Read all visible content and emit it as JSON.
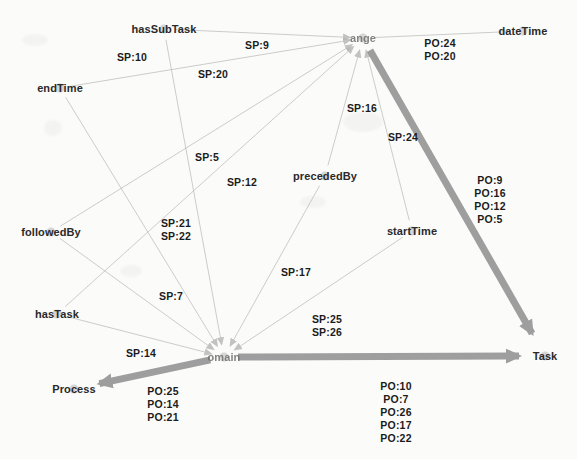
{
  "diagram": {
    "colors": {
      "thin_edge": "#b9b9b9",
      "thick_edge": "#9a9a9a",
      "node_text": "#2a2a2a",
      "label_text": "#1b1b1b",
      "background": "#fbfbfa"
    },
    "nodes": [
      {
        "id": "hasSubTask",
        "label": "hasSubTask",
        "x": 164,
        "y": 29,
        "faded": false
      },
      {
        "id": "dateTime",
        "label": "dateTime",
        "x": 523,
        "y": 31,
        "faded": false
      },
      {
        "id": "range",
        "label": "ange",
        "x": 363,
        "y": 38,
        "faded": true
      },
      {
        "id": "endTime",
        "label": "endTime",
        "x": 60,
        "y": 88,
        "faded": false
      },
      {
        "id": "precededBy",
        "label": "precededBy",
        "x": 325,
        "y": 176,
        "faded": false
      },
      {
        "id": "followedBy",
        "label": "followedBy",
        "x": 51,
        "y": 232,
        "faded": false
      },
      {
        "id": "startTime",
        "label": "startTime",
        "x": 412,
        "y": 231,
        "faded": false
      },
      {
        "id": "hasTask",
        "label": "hasTask",
        "x": 57,
        "y": 314,
        "faded": false
      },
      {
        "id": "domain",
        "label": "omain",
        "x": 224,
        "y": 357,
        "faded": true
      },
      {
        "id": "Task",
        "label": "Task",
        "x": 545,
        "y": 356,
        "faded": false
      },
      {
        "id": "Process",
        "label": "Process",
        "x": 74,
        "y": 389,
        "faded": false
      }
    ],
    "edge_labels": [
      {
        "id": "sp9",
        "text": "SP:9",
        "x": 257,
        "y": 45
      },
      {
        "id": "sp10",
        "text": "SP:10",
        "x": 132,
        "y": 57
      },
      {
        "id": "po24_20",
        "text": "PO:24\nPO:20",
        "x": 440,
        "y": 50
      },
      {
        "id": "sp20",
        "text": "SP:20",
        "x": 213,
        "y": 74
      },
      {
        "id": "sp16",
        "text": "SP:16",
        "x": 362,
        "y": 108
      },
      {
        "id": "sp24",
        "text": "SP:24",
        "x": 403,
        "y": 137
      },
      {
        "id": "sp5",
        "text": "SP:5",
        "x": 207,
        "y": 157
      },
      {
        "id": "sp12",
        "text": "SP:12",
        "x": 242,
        "y": 182
      },
      {
        "id": "po_right",
        "text": "PO:9\nPO:16\nPO:12\nPO:5",
        "x": 490,
        "y": 200
      },
      {
        "id": "sp21_22",
        "text": "SP:21\nSP:22",
        "x": 176,
        "y": 230
      },
      {
        "id": "sp17",
        "text": "SP:17",
        "x": 296,
        "y": 272
      },
      {
        "id": "sp7",
        "text": "SP:7",
        "x": 171,
        "y": 296
      },
      {
        "id": "sp25_26",
        "text": "SP:25\nSP:26",
        "x": 327,
        "y": 326
      },
      {
        "id": "sp14",
        "text": "SP:14",
        "x": 141,
        "y": 353
      },
      {
        "id": "po25_14_21",
        "text": "PO:25\nPO:14\nPO:21",
        "x": 163,
        "y": 404
      },
      {
        "id": "po_bottom",
        "text": "PO:10\nPO:7\nPO:26\nPO:17\nPO:22",
        "x": 396,
        "y": 412
      }
    ],
    "edges": [
      {
        "id": "hasSubTask-range",
        "from": "hasSubTask",
        "to": "range",
        "weight": "thin",
        "arrow": true
      },
      {
        "id": "endTime-range",
        "from": "endTime",
        "to": "range",
        "weight": "thin",
        "arrow": true
      },
      {
        "id": "precededBy-range",
        "from": "precededBy",
        "to": "range",
        "weight": "thin",
        "arrow": true
      },
      {
        "id": "startTime-range",
        "from": "startTime",
        "to": "range",
        "weight": "thin",
        "arrow": true
      },
      {
        "id": "followedBy-range",
        "from": "followedBy",
        "to": "range",
        "weight": "thin",
        "arrow": true
      },
      {
        "id": "hasTask-range",
        "from": "hasTask",
        "to": "range",
        "weight": "thin",
        "arrow": true
      },
      {
        "id": "range-dateTime",
        "from": "range",
        "to": "dateTime",
        "weight": "thin",
        "arrow": false
      },
      {
        "id": "range-Task",
        "from": "range",
        "to": "Task",
        "weight": "thick",
        "arrow": true
      },
      {
        "id": "hasSubTask-domain",
        "from": "hasSubTask",
        "to": "domain",
        "weight": "thin",
        "arrow": true
      },
      {
        "id": "endTime-domain",
        "from": "endTime",
        "to": "domain",
        "weight": "thin",
        "arrow": true
      },
      {
        "id": "followedBy-domain",
        "from": "followedBy",
        "to": "domain",
        "weight": "thin",
        "arrow": true
      },
      {
        "id": "hasTask-domain",
        "from": "hasTask",
        "to": "domain",
        "weight": "thin",
        "arrow": true
      },
      {
        "id": "precededBy-domain",
        "from": "precededBy",
        "to": "domain",
        "weight": "thin",
        "arrow": true
      },
      {
        "id": "startTime-domain",
        "from": "startTime",
        "to": "domain",
        "weight": "thin",
        "arrow": true
      },
      {
        "id": "domain-Process",
        "from": "domain",
        "to": "Process",
        "weight": "thick",
        "arrow": true
      },
      {
        "id": "domain-Task",
        "from": "domain",
        "to": "Task",
        "weight": "thick",
        "arrow": true
      }
    ]
  }
}
